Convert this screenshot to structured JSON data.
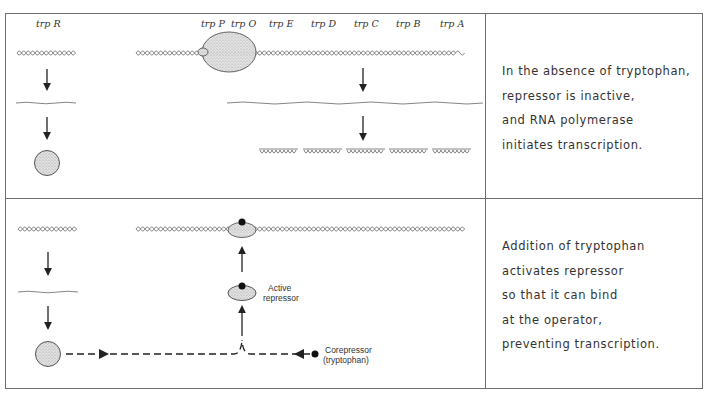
{
  "panels": [
    {
      "id": "absence",
      "caption_lines": [
        "In the absence of tryptophan,",
        "repressor is inactive,",
        "and RNA polymerase",
        "initiates transcription."
      ]
    },
    {
      "id": "presence",
      "caption_lines": [
        "Addition of tryptophan",
        "activates repressor",
        "so that it can bind",
        "at the operator,",
        "preventing transcription."
      ],
      "labels": {
        "active_repressor_line1": "Active",
        "active_repressor_line2": "repressor",
        "corepressor_line1": "Corepressor",
        "corepressor_line2": "(tryptophan)"
      }
    }
  ],
  "gene_labels": {
    "trpR": "trp R",
    "trpP": "trp P",
    "trpO": "trp O",
    "trpE": "trp E",
    "trpD": "trp D",
    "trpC": "trp C",
    "trpB": "trp B",
    "trpA": "trp A"
  },
  "colors": {
    "line": "#6e6e6e",
    "ink": "#222222",
    "stipple": "#d9d9d9"
  }
}
